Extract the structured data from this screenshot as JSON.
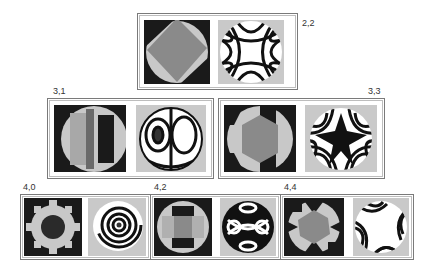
{
  "figure": {
    "panels": [
      {
        "id": "2,2",
        "label": "2,2",
        "phase_pattern": "rotated-square",
        "fringe_pattern": "astigmatism-saddle"
      },
      {
        "id": "3,1",
        "label": "3,1",
        "phase_pattern": "vertical-bands",
        "fringe_pattern": "coma-two-lobes"
      },
      {
        "id": "3,3",
        "label": "3,3",
        "phase_pattern": "hexagon-trefoil",
        "fringe_pattern": "trefoil-star"
      },
      {
        "id": "4,0",
        "label": "4,0",
        "phase_pattern": "gear-ring",
        "fringe_pattern": "concentric-rings"
      },
      {
        "id": "4,2",
        "label": "4,2",
        "phase_pattern": "cross-blocks",
        "fringe_pattern": "secondary-astigmatism"
      },
      {
        "id": "4,4",
        "label": "4,4",
        "phase_pattern": "quatrefoil",
        "fringe_pattern": "tetrafoil"
      }
    ],
    "colors": {
      "border": "#7a7a7a",
      "dark": "#1a1a1a",
      "mid": "#8a8a8a",
      "light": "#c8c8c8",
      "fringe_bg": "#c9c9c9"
    }
  }
}
